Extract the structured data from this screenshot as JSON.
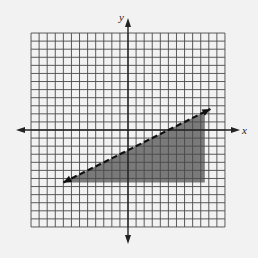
{
  "chart_data": {
    "type": "inequality-graph",
    "title": "",
    "xlabel": "x",
    "ylabel": "y",
    "xlim": [
      -12,
      12
    ],
    "ylim": [
      -12,
      12
    ],
    "grid": true,
    "grid_step": 1,
    "tick_labels": [],
    "boundary_line": {
      "equation": "y = 0.5x - 2.5",
      "style": "dashed",
      "slope": 0.5,
      "intercept": -2.5,
      "from": [
        -8,
        -6.5
      ],
      "to": [
        10.2,
        2.6
      ],
      "arrowheads": true
    },
    "shaded_region": {
      "description": "region below dashed line, bounded approximately by x <= 9.5 and y >= -6.5",
      "vertices": [
        [
          -8,
          -6.5
        ],
        [
          9.5,
          2.25
        ],
        [
          9.5,
          -6.5
        ]
      ],
      "color": "#7a7a7a"
    }
  },
  "labels": {
    "x_axis": "x",
    "y_axis": "y"
  },
  "colors": {
    "background": "#f2f2f2",
    "grid": "#4a4a4a",
    "axis": "#222222",
    "shade": "#7a7a7a"
  }
}
